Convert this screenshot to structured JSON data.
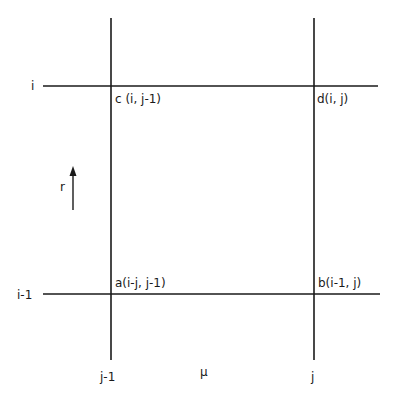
{
  "diagram": {
    "type": "finite-difference grid cell",
    "axes": {
      "vertical_axis_label": "r",
      "horizontal_axis_label": "μ"
    },
    "row_labels": {
      "top": "i",
      "bottom": "i-1"
    },
    "column_labels": {
      "left": "j-1",
      "right": "j"
    },
    "nodes": {
      "a": "a(i-j, j-1)",
      "b": "b(i-1, j)",
      "c": "c (i, j-1)",
      "d": "d(i, j)"
    },
    "colors": {
      "line": "#1a1a1a",
      "background": "#ffffff"
    }
  }
}
